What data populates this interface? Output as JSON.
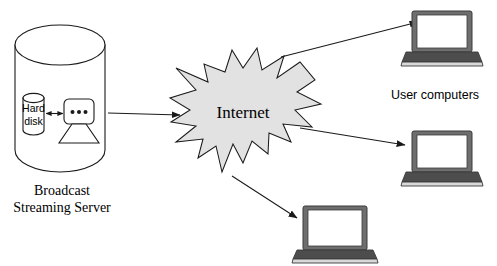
{
  "diagram": {
    "background_color": "#ffffff",
    "stroke_color": "#1a1a1a",
    "star_fill_color": "#e2e2e2",
    "laptop_body_color": "#6e6e6e",
    "laptop_screen_color": "#ffffff",
    "laptop_keyboard_color": "#4d4d4d",
    "laptop_base_color": "#d8d8d8"
  },
  "server": {
    "caption_line1": "Broadcast",
    "caption_line2": "Streaming Server",
    "hard_disk_label_line1": "Hard",
    "hard_disk_label_line2": "disk",
    "processor_dots": "• • •"
  },
  "cloud": {
    "label": "Internet"
  },
  "clients": {
    "group_label": "User computers",
    "items": [
      {
        "id": "laptop-top",
        "label": ""
      },
      {
        "id": "laptop-middle",
        "label": ""
      },
      {
        "id": "laptop-bottom",
        "label": ""
      }
    ]
  },
  "connections": [
    {
      "id": "server-to-internet",
      "from": "Broadcast Streaming Server",
      "to": "Internet"
    },
    {
      "id": "internet-to-laptop-top",
      "from": "Internet",
      "to": "User computer 1"
    },
    {
      "id": "internet-to-laptop-middle",
      "from": "Internet",
      "to": "User computer 2"
    },
    {
      "id": "internet-to-laptop-bottom",
      "from": "Internet",
      "to": "User computer 3"
    },
    {
      "id": "harddisk-to-processor",
      "from": "Hard disk",
      "to": "Processor"
    }
  ]
}
